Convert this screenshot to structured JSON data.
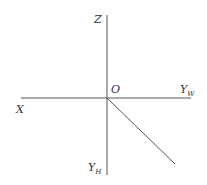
{
  "diagram": {
    "type": "coordinate-axes",
    "colors": {
      "line": "#555555",
      "text": "#333333",
      "background": "#ffffff"
    },
    "labels": {
      "z": {
        "main": "Z",
        "sub": ""
      },
      "origin": {
        "main": "O",
        "sub": ""
      },
      "yw": {
        "main": "Y",
        "sub": "W"
      },
      "x": {
        "main": "X",
        "sub": ""
      },
      "yh": {
        "main": "Y",
        "sub": "H"
      }
    },
    "lines": [
      {
        "name": "z-axis-vertical",
        "x1": 107,
        "y1": 15,
        "x2": 107,
        "y2": 175
      },
      {
        "name": "x-yw-axis-horizontal",
        "x1": 21,
        "y1": 98,
        "x2": 191,
        "y2": 98
      },
      {
        "name": "45-degree-diagonal",
        "x1": 107,
        "y1": 98,
        "x2": 175,
        "y2": 164
      }
    ]
  }
}
